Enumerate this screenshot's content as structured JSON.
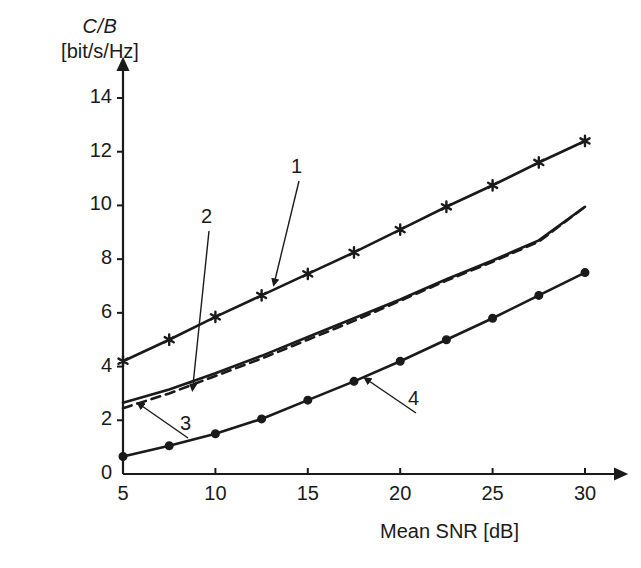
{
  "chart_data": {
    "type": "line",
    "title": "",
    "ylabel": "C/B",
    "ylabel_main": "C/B",
    "ylabel_units": "[bit/s/Hz]",
    "xlabel": "Mean SNR [dB]",
    "xlim": [
      5,
      30
    ],
    "ylim": [
      0,
      15
    ],
    "xticks": [
      5,
      10,
      15,
      20,
      25,
      30
    ],
    "yticks": [
      0,
      2,
      4,
      6,
      8,
      10,
      12,
      14
    ],
    "xtick_labels": [
      "5",
      "10",
      "15",
      "20",
      "25",
      "30"
    ],
    "ytick_labels": [
      "0",
      "2",
      "4",
      "6",
      "8",
      "10",
      "12",
      "14"
    ],
    "grid": false,
    "legend": "none",
    "x": [
      5,
      7.5,
      10,
      12.5,
      15,
      17.5,
      20,
      22.5,
      25,
      27.5,
      30
    ],
    "series": [
      {
        "name": "1",
        "marker": "star",
        "linestyle": "solid",
        "color": "#1a1a1a",
        "values": [
          4.2,
          5.0,
          5.85,
          6.65,
          7.45,
          8.25,
          9.1,
          9.95,
          10.75,
          11.6,
          12.4
        ]
      },
      {
        "name": "2",
        "marker": "none",
        "linestyle": "solid",
        "color": "#1a1a1a",
        "values": [
          2.65,
          3.15,
          3.75,
          4.4,
          5.1,
          5.8,
          6.5,
          7.25,
          7.95,
          8.7,
          9.95
        ]
      },
      {
        "name": "3",
        "marker": "none",
        "linestyle": "dashed",
        "color": "#1a1a1a",
        "values": [
          2.45,
          3.0,
          3.65,
          4.3,
          5.0,
          5.7,
          6.45,
          7.2,
          7.9,
          8.65,
          9.95
        ]
      },
      {
        "name": "4",
        "marker": "circle",
        "linestyle": "solid",
        "color": "#1a1a1a",
        "values": [
          0.65,
          1.05,
          1.5,
          2.05,
          2.75,
          3.45,
          4.2,
          5.0,
          5.8,
          6.65,
          7.5
        ]
      }
    ],
    "annotations": [
      {
        "label": "1",
        "label_x": 297,
        "label_y": 167,
        "tip_x": 275,
        "tip_y": 280
      },
      {
        "label": "2",
        "label_x": 207,
        "label_y": 217,
        "tip_x": 193,
        "tip_y": 385
      },
      {
        "label": "3",
        "label_x": 186,
        "label_y": 424,
        "tip_x": 142,
        "tip_y": 406
      },
      {
        "label": "4",
        "label_x": 414,
        "label_y": 399,
        "tip_x": 369,
        "tip_y": 381
      }
    ]
  },
  "axis": {
    "y_title_main": "C/B",
    "y_title_units": "[bit/s/Hz]",
    "x_title": "Mean SNR [dB]"
  },
  "colors": {
    "ink": "#1a1a1a",
    "background": "#ffffff"
  }
}
